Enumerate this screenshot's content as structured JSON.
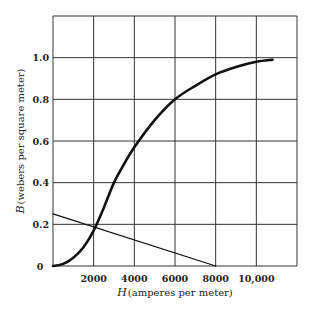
{
  "chart_data": {
    "type": "line",
    "title": "",
    "xlabel": "H (amperes per meter)",
    "ylabel": "B (webers per square meter)",
    "xlabel_symbol": "H",
    "xlabel_units": "(amperes per meter)",
    "ylabel_symbol": "B",
    "ylabel_units": "(webers per square meter)",
    "xlim": [
      0,
      12000
    ],
    "ylim": [
      0,
      1.2
    ],
    "grid": true,
    "legend": "none",
    "x_ticks": [
      0,
      2000,
      4000,
      6000,
      8000,
      10000
    ],
    "x_tick_labels": [
      "0",
      "2000",
      "4000",
      "6000",
      "8000",
      "10,000"
    ],
    "y_ticks": [
      0.2,
      0.4,
      0.6,
      0.8,
      1.0
    ],
    "y_tick_labels": [
      "0.2",
      "0.4",
      "0.6",
      "0.8",
      "1.0"
    ],
    "series": [
      {
        "name": "B-H magnetization curve",
        "style": "thick",
        "x": [
          0,
          500,
          1000,
          1500,
          2000,
          2500,
          3000,
          3500,
          4000,
          5000,
          6000,
          7000,
          8000,
          9000,
          10000,
          10800
        ],
        "y": [
          0,
          0.01,
          0.04,
          0.09,
          0.17,
          0.28,
          0.4,
          0.49,
          0.57,
          0.7,
          0.8,
          0.865,
          0.92,
          0.955,
          0.98,
          0.99
        ]
      },
      {
        "name": "Load line",
        "style": "thin",
        "x": [
          0,
          8000
        ],
        "y": [
          0.25,
          0
        ]
      }
    ],
    "annotations": [
      {
        "type": "intersection",
        "x": 2100,
        "y": 0.19
      }
    ]
  }
}
